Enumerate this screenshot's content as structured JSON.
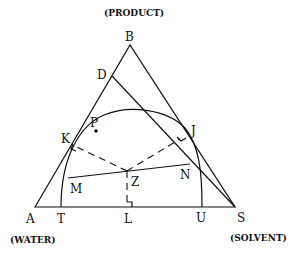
{
  "diagram": {
    "type": "ternary-phase-diagram",
    "captions": {
      "top": "(PRODUCT)",
      "bottom_left": "(WATER)",
      "bottom_right": "(SOLVENT)"
    },
    "vertices": {
      "A": "A",
      "B": "B",
      "S": "S"
    },
    "points": {
      "D": "D",
      "P": "P",
      "K": "K",
      "J": "J",
      "M": "M",
      "N": "N",
      "Z": "Z",
      "T": "T",
      "L": "L",
      "U": "U"
    },
    "elements": [
      "triangle A-B-S",
      "binodal curve from T through P to U",
      "line D-S tangent to curve",
      "tie line M-N through Z",
      "dashed perpendicular Z-K to side AB",
      "dashed perpendicular Z-J to side BS",
      "dashed perpendicular Z-L to base AS"
    ]
  }
}
